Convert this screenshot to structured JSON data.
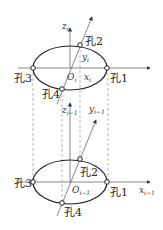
{
  "diagram": {
    "upper": {
      "holes": [
        "孔1",
        "孔2",
        "孔3",
        "孔4"
      ],
      "axes": {
        "z": "z",
        "y": "y",
        "x": "x",
        "origin": "O",
        "subscript": "i"
      }
    },
    "lower": {
      "holes": [
        "孔1",
        "孔2",
        "孔3",
        "孔4"
      ],
      "axes": {
        "z": "z",
        "y": "y",
        "x": "x",
        "origin": "O",
        "subscript": "i−1"
      }
    },
    "colors": {
      "line": "#222222",
      "dashed": "#888888",
      "background": "#ffffff"
    }
  }
}
